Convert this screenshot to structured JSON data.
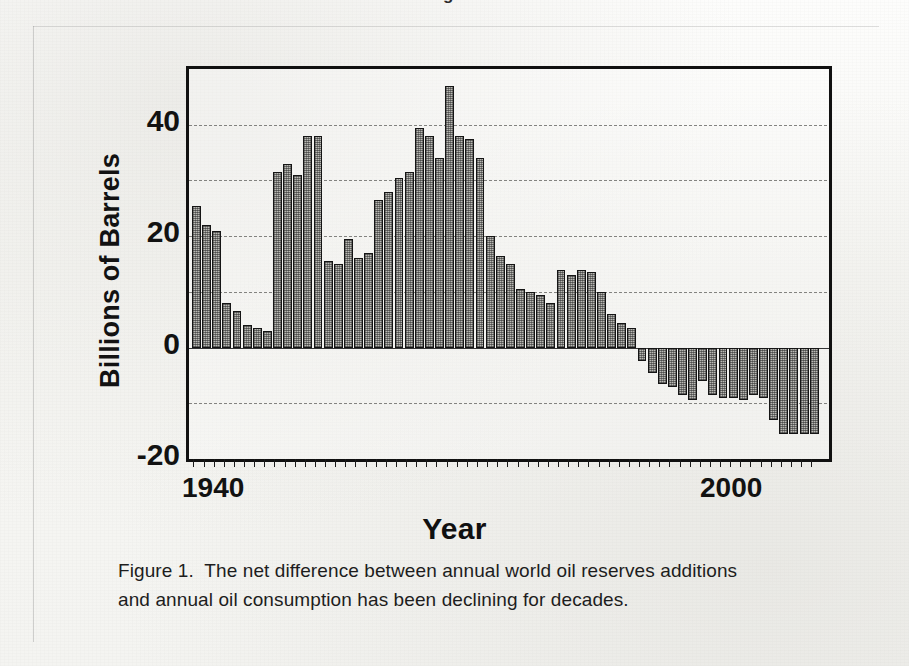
{
  "document": {
    "cut_off_header": "Figure",
    "caption_line_1": "Figure 1.  The net difference between annual world oil reserves additions",
    "caption_line_2": "and annual oil consumption has been declining for decades."
  },
  "chart_data": {
    "type": "bar",
    "title": "",
    "xlabel": "Year",
    "ylabel": "Billions of Barrels",
    "ylim": [
      -20,
      50
    ],
    "xlim": [
      1939.5,
      2001.5
    ],
    "ytick_labels": [
      "40",
      "20",
      "0",
      "-20"
    ],
    "ytick_values": [
      40,
      20,
      0,
      -20
    ],
    "gridline_values": [
      40,
      30,
      20,
      10,
      0,
      -10
    ],
    "grid": true,
    "legend": "none",
    "xtick_labels": [
      "1940",
      "2000"
    ],
    "xtick_label_values": [
      1940,
      2000
    ],
    "bar_color": "#b9b9b4",
    "bar_edge_color": "#151515",
    "x": [
      1940,
      1941,
      1942,
      1943,
      1944,
      1945,
      1946,
      1947,
      1948,
      1949,
      1950,
      1951,
      1952,
      1953,
      1954,
      1955,
      1956,
      1957,
      1958,
      1959,
      1960,
      1961,
      1962,
      1963,
      1964,
      1965,
      1966,
      1967,
      1968,
      1969,
      1970,
      1971,
      1972,
      1973,
      1974,
      1975,
      1976,
      1977,
      1978,
      1979,
      1980,
      1981,
      1982,
      1983,
      1984,
      1985,
      1986,
      1987,
      1988,
      1989,
      1990,
      1991,
      1992,
      1993,
      1994,
      1995,
      1996,
      1997,
      1998,
      1999,
      2000,
      2001
    ],
    "values": [
      25.5,
      22.0,
      21.0,
      8.0,
      6.5,
      4.0,
      3.5,
      3.0,
      31.5,
      33.0,
      31.0,
      38.0,
      38.0,
      15.5,
      15.0,
      19.5,
      16.0,
      17.0,
      26.5,
      28.0,
      30.5,
      31.5,
      39.5,
      38.0,
      34.0,
      47.0,
      38.0,
      37.5,
      34.0,
      20.0,
      16.5,
      15.0,
      10.5,
      10.0,
      9.5,
      8.0,
      14.0,
      13.0,
      14.0,
      13.5,
      10.0,
      6.0,
      4.5,
      3.5,
      -2.5,
      -4.5,
      -6.5,
      -7.0,
      -8.5,
      -9.5,
      -6.0,
      -8.5,
      -9.0,
      -9.0,
      -9.5,
      -8.5,
      -9.0,
      -13.0,
      -15.5,
      -15.5,
      -15.5,
      -15.5
    ],
    "n_bars": 62
  }
}
